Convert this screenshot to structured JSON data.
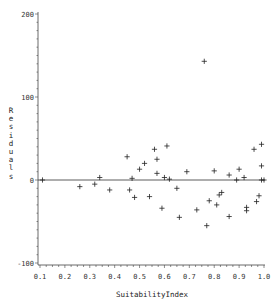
{
  "chart_data": {
    "type": "scatter",
    "title": "",
    "xlabel": "SuitabilityIndex",
    "ylabel": "Residuals",
    "xlim": [
      0.1,
      1.0
    ],
    "ylim": [
      -100,
      200
    ],
    "xticks": [
      "0.1",
      "0.2",
      "0.3",
      "0.4",
      "0.5",
      "0.6",
      "0.7",
      "0.8",
      "0.9",
      "1.0"
    ],
    "yticks": [
      "200",
      "100",
      "0",
      "-100"
    ],
    "marker": "+",
    "reference_line_y": 0,
    "grid": false,
    "legend": null,
    "series": [
      {
        "name": "Residuals",
        "points": [
          {
            "x": 0.11,
            "y": 0
          },
          {
            "x": 0.26,
            "y": -8
          },
          {
            "x": 0.32,
            "y": -5
          },
          {
            "x": 0.34,
            "y": 3
          },
          {
            "x": 0.38,
            "y": -12
          },
          {
            "x": 0.45,
            "y": 28
          },
          {
            "x": 0.46,
            "y": -12
          },
          {
            "x": 0.47,
            "y": 2
          },
          {
            "x": 0.48,
            "y": -21
          },
          {
            "x": 0.5,
            "y": 13
          },
          {
            "x": 0.52,
            "y": 20
          },
          {
            "x": 0.54,
            "y": -20
          },
          {
            "x": 0.56,
            "y": 37
          },
          {
            "x": 0.57,
            "y": 25
          },
          {
            "x": 0.57,
            "y": 8
          },
          {
            "x": 0.59,
            "y": -34
          },
          {
            "x": 0.6,
            "y": 3
          },
          {
            "x": 0.61,
            "y": 41
          },
          {
            "x": 0.62,
            "y": 1
          },
          {
            "x": 0.65,
            "y": -10
          },
          {
            "x": 0.66,
            "y": -45
          },
          {
            "x": 0.69,
            "y": 10
          },
          {
            "x": 0.73,
            "y": -36
          },
          {
            "x": 0.76,
            "y": 143
          },
          {
            "x": 0.77,
            "y": -55
          },
          {
            "x": 0.78,
            "y": -25
          },
          {
            "x": 0.8,
            "y": 11
          },
          {
            "x": 0.81,
            "y": -30
          },
          {
            "x": 0.82,
            "y": -18
          },
          {
            "x": 0.83,
            "y": -15
          },
          {
            "x": 0.86,
            "y": -44
          },
          {
            "x": 0.86,
            "y": 6
          },
          {
            "x": 0.89,
            "y": 0
          },
          {
            "x": 0.9,
            "y": 13
          },
          {
            "x": 0.92,
            "y": 3
          },
          {
            "x": 0.93,
            "y": -33
          },
          {
            "x": 0.93,
            "y": -37
          },
          {
            "x": 0.96,
            "y": 37
          },
          {
            "x": 0.97,
            "y": -26
          },
          {
            "x": 0.98,
            "y": -19
          },
          {
            "x": 0.99,
            "y": 43
          },
          {
            "x": 0.99,
            "y": 17
          },
          {
            "x": 0.99,
            "y": 0
          },
          {
            "x": 1.0,
            "y": 0
          }
        ]
      }
    ]
  },
  "colors": {
    "axis": "#444444",
    "marker": "#222222",
    "reference_line": "#333333",
    "background": "#ffffff"
  }
}
